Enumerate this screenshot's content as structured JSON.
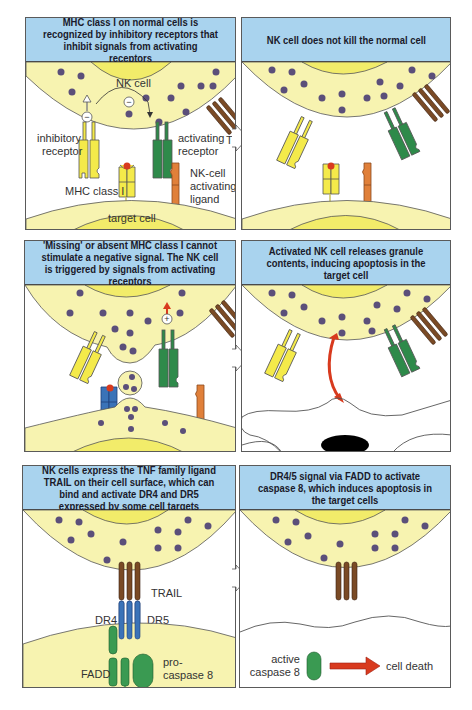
{
  "panels": [
    {
      "id": "p1",
      "header": "MHC class I on normal cells is recognized by inhibitory receptors that inhibit signals from activating receptors",
      "labels": {
        "nk_cell": "NK cell",
        "inhibitory_receptor_1": "inhibitory",
        "inhibitory_receptor_2": "receptor",
        "activating_receptor_1": "activating",
        "activating_receptor_2": "receptor",
        "trail": "TRAIL",
        "nk_ligand_1": "NK-cell",
        "nk_ligand_2": "activating",
        "nk_ligand_3": "ligand",
        "mhc": "MHC class I",
        "target_cell": "target cell",
        "minus_1": "−",
        "minus_2": "−"
      }
    },
    {
      "id": "p2",
      "header": "NK cell does not kill the normal cell"
    },
    {
      "id": "p3",
      "header": "'Missing' or absent MHC class I cannot stimulate a negative signal. The NK cell is triggered by signals from activating receptors",
      "labels": {
        "plus": "+"
      }
    },
    {
      "id": "p4",
      "header": "Activated NK cell releases granule contents, inducing apoptosis in the target cell"
    },
    {
      "id": "p5",
      "header": "NK cells express the TNF family ligand TRAIL on their cell surface, which can bind and activate DR4 and DR5 expressed by some cell targets",
      "labels": {
        "trail": "TRAIL",
        "dr4": "DR4",
        "dr5": "DR5",
        "fadd": "FADD",
        "procaspase_1": "pro-",
        "procaspase_2": "caspase 8"
      }
    },
    {
      "id": "p6",
      "header": "DR4/5 signal via FADD to activate caspase 8, which induces apoptosis in the target cells",
      "labels": {
        "active_1": "active",
        "active_2": "caspase 8",
        "cell_death": "cell death"
      }
    }
  ],
  "colors": {
    "header_bg": "#a9d3ee",
    "cell_fill": "#f7f3b0",
    "nucleus_fill": "#f2ec6a",
    "granule": "#5b4f7a",
    "inhibitory_receptor": "#f4ea4a",
    "activating_receptor": "#2e8a4a",
    "trail": "#7a4a25",
    "nk_ligand": "#e0803a",
    "death_receptor": "#3a73b8",
    "fadd": "#3a9a52",
    "red_arrow": "#d83a1e"
  }
}
